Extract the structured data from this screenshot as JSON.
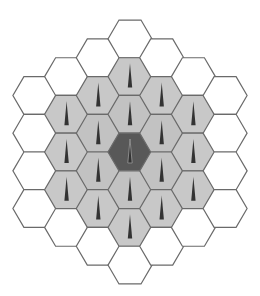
{
  "diagram": {
    "title": "",
    "type": "hexagonal-cell-cluster",
    "center": {
      "x": 130,
      "y": 152
    },
    "hex_radius": 22,
    "col_spacing": 31.7,
    "row_height": 37.7,
    "colors": {
      "stroke": "#6a6a6a",
      "center_fill": "#585858",
      "ring1_fill": "#c2c2c2",
      "ring2_fill": "#c8c8c8",
      "outer_fill": "#ffffff",
      "antenna": "#333333",
      "antenna_center_outline": "#9a9a9a"
    },
    "ring_styles": [
      {
        "ring": 0,
        "fill_key": "center_fill",
        "antenna": true
      },
      {
        "ring": 1,
        "fill_key": "ring1_fill",
        "antenna": true
      },
      {
        "ring": 2,
        "fill_key": "ring2_fill",
        "antenna": true
      },
      {
        "ring": 3,
        "fill_key": "outer_fill",
        "antenna": false
      }
    ],
    "cells": [
      {
        "q": -3,
        "r": 0
      },
      {
        "q": -3,
        "r": 1
      },
      {
        "q": -3,
        "r": 2
      },
      {
        "q": -3,
        "r": 3
      },
      {
        "q": -2,
        "r": -1
      },
      {
        "q": -2,
        "r": 0
      },
      {
        "q": -2,
        "r": 1
      },
      {
        "q": -2,
        "r": 2
      },
      {
        "q": -2,
        "r": 3
      },
      {
        "q": -1,
        "r": -2
      },
      {
        "q": -1,
        "r": -1
      },
      {
        "q": -1,
        "r": 0
      },
      {
        "q": -1,
        "r": 1
      },
      {
        "q": -1,
        "r": 2
      },
      {
        "q": -1,
        "r": 3
      },
      {
        "q": 0,
        "r": -3
      },
      {
        "q": 0,
        "r": -2
      },
      {
        "q": 0,
        "r": -1
      },
      {
        "q": 0,
        "r": 0
      },
      {
        "q": 0,
        "r": 1
      },
      {
        "q": 0,
        "r": 2
      },
      {
        "q": 0,
        "r": 3
      },
      {
        "q": 1,
        "r": -3
      },
      {
        "q": 1,
        "r": -2
      },
      {
        "q": 1,
        "r": -1
      },
      {
        "q": 1,
        "r": 0
      },
      {
        "q": 1,
        "r": 1
      },
      {
        "q": 1,
        "r": 2
      },
      {
        "q": 2,
        "r": -3
      },
      {
        "q": 2,
        "r": -2
      },
      {
        "q": 2,
        "r": -1
      },
      {
        "q": 2,
        "r": 0
      },
      {
        "q": 2,
        "r": 1
      },
      {
        "q": 3,
        "r": -3
      },
      {
        "q": 3,
        "r": -2
      },
      {
        "q": 3,
        "r": -1
      },
      {
        "q": 3,
        "r": 0
      }
    ],
    "summary": {
      "total_cells": 37,
      "cells_with_antenna": 19,
      "center_cells": 1,
      "ring1_cells": 6,
      "ring2_cells": 12,
      "ring3_cells": 18
    }
  }
}
